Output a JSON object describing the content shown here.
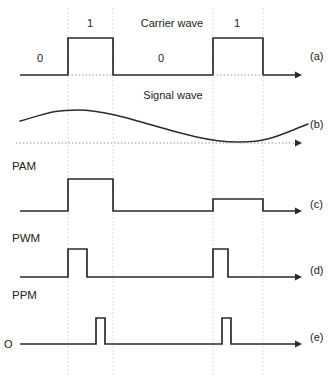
{
  "figure": {
    "title_carrier": "Carrier wave",
    "title_signal": "Signal wave",
    "origin_label": "O",
    "row_labels": {
      "pam": "PAM",
      "pwm": "PWM",
      "ppm": "PPM"
    },
    "side_labels": {
      "a": "(a)",
      "b": "(b)",
      "c": "(c)",
      "d": "(d)",
      "e": "(e)"
    },
    "bit_labels": [
      {
        "text": "0",
        "x": 40,
        "y": 62
      },
      {
        "text": "1",
        "x": 90,
        "y": 27
      },
      {
        "text": "0",
        "x": 161,
        "y": 62
      },
      {
        "text": "1",
        "x": 237,
        "y": 27
      }
    ],
    "colors": {
      "stroke": "#2b2b2b",
      "guide": "#c9c9c9",
      "dotted_base": "#9a9a9a",
      "text": "#222222",
      "background": "#ffffff"
    }
  },
  "chart_data": {
    "type": "line",
    "xlabel": "",
    "ylabel": "",
    "xlim": [
      20,
      310
    ],
    "grid": "vertical dotted guides at pulse edges",
    "legend_position": "right side row labels (a)-(e)",
    "guides_x": [
      68,
      113,
      213,
      263
    ],
    "series": [
      {
        "name": "Carrier wave",
        "row": "a",
        "type": "square-pulse-train",
        "baseline_y": 75,
        "high_y": 38,
        "pulses": [
          {
            "start_x": 68,
            "end_x": 113
          },
          {
            "start_x": 213,
            "end_x": 263
          }
        ],
        "x_start": 20,
        "x_end": 300,
        "dotted_baseline_segments": [
          {
            "from_x": 68,
            "to_x": 113
          },
          {
            "from_x": 213,
            "to_x": 263
          }
        ]
      },
      {
        "name": "Signal wave",
        "row": "b",
        "type": "sine",
        "baseline_y": 143,
        "x_start": 20,
        "x_end": 308,
        "peak": {
          "x": 78,
          "y": 110
        },
        "trough": {
          "x": 237,
          "y": 142
        },
        "start_y": 121,
        "end_y": 124
      },
      {
        "name": "PAM",
        "row": "c",
        "type": "amplitude-modulated-pulses",
        "baseline_y": 211,
        "x_start": 20,
        "x_end": 300,
        "pulses": [
          {
            "start_x": 68,
            "end_x": 113,
            "top_y": 179
          },
          {
            "start_x": 213,
            "end_x": 263,
            "top_y": 199
          }
        ]
      },
      {
        "name": "PWM",
        "row": "d",
        "type": "width-modulated-pulses",
        "baseline_y": 277,
        "x_start": 20,
        "x_end": 300,
        "pulses": [
          {
            "start_x": 68,
            "end_x": 87,
            "top_y": 249
          },
          {
            "start_x": 213,
            "end_x": 228,
            "top_y": 249
          }
        ]
      },
      {
        "name": "PPM",
        "row": "e",
        "type": "position-modulated-pulses",
        "baseline_y": 344,
        "x_start": 20,
        "x_end": 300,
        "pulses": [
          {
            "start_x": 96,
            "end_x": 105,
            "top_y": 318
          },
          {
            "start_x": 222,
            "end_x": 231,
            "top_y": 318
          }
        ]
      }
    ]
  }
}
